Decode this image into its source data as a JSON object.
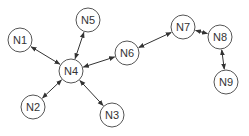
{
  "diagram": {
    "type": "network graph",
    "node_radius": 12,
    "colors": {
      "node_stroke": "#555555",
      "node_fill": "#ffffff",
      "edge": "#333333",
      "text": "#333333"
    },
    "nodes": [
      {
        "id": "N1",
        "label": "N1",
        "x": 20,
        "y": 40
      },
      {
        "id": "N2",
        "label": "N2",
        "x": 33,
        "y": 107
      },
      {
        "id": "N3",
        "label": "N3",
        "x": 112,
        "y": 115
      },
      {
        "id": "N4",
        "label": "N4",
        "x": 71,
        "y": 71
      },
      {
        "id": "N5",
        "label": "N5",
        "x": 88,
        "y": 20
      },
      {
        "id": "N6",
        "label": "N6",
        "x": 127,
        "y": 53
      },
      {
        "id": "N7",
        "label": "N7",
        "x": 183,
        "y": 27
      },
      {
        "id": "N8",
        "label": "N8",
        "x": 220,
        "y": 37
      },
      {
        "id": "N9",
        "label": "N9",
        "x": 226,
        "y": 82
      }
    ],
    "edges": [
      {
        "from": "N4",
        "to": "N1",
        "bidirectional": true
      },
      {
        "from": "N4",
        "to": "N5",
        "bidirectional": true
      },
      {
        "from": "N4",
        "to": "N2",
        "bidirectional": true
      },
      {
        "from": "N4",
        "to": "N3",
        "bidirectional": true
      },
      {
        "from": "N4",
        "to": "N6",
        "bidirectional": true
      },
      {
        "from": "N6",
        "to": "N7",
        "bidirectional": true
      },
      {
        "from": "N7",
        "to": "N8",
        "bidirectional": true
      },
      {
        "from": "N8",
        "to": "N9",
        "bidirectional": true
      }
    ]
  }
}
